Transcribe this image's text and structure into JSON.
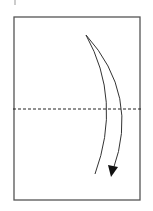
{
  "diagram": {
    "type": "origami-fold-step",
    "paper": {
      "x": 14,
      "y": 17,
      "width": 126,
      "height": 183,
      "stroke": "#555555"
    },
    "fold_line": {
      "style": "valley-dashed",
      "y": 109,
      "x1": 13,
      "x2": 141,
      "stroke": "#222222"
    },
    "arrow": {
      "direction": "down",
      "meaning": "fold top half down",
      "stroke": "#222222"
    },
    "top_mark": {
      "x": 15,
      "y1": 0,
      "y2": 5
    }
  }
}
